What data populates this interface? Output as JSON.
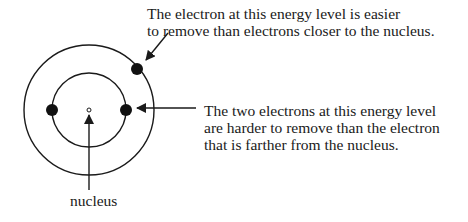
{
  "diagram": {
    "type": "atomic-energy-levels",
    "colors": {
      "stroke": "#1a1a1a",
      "background": "#ffffff"
    },
    "labels": {
      "outer_electron": {
        "line1": "The electron at this energy level is easier",
        "line2": "to remove than electrons closer to the nucleus."
      },
      "inner_electrons": {
        "line1": "The two electrons at this energy level",
        "line2": "are harder to remove than the electron",
        "line3": "that is farther from the nucleus."
      },
      "nucleus": "nucleus"
    },
    "energy_levels": [
      {
        "name": "inner",
        "electrons": 2
      },
      {
        "name": "outer",
        "electrons": 1
      }
    ]
  }
}
